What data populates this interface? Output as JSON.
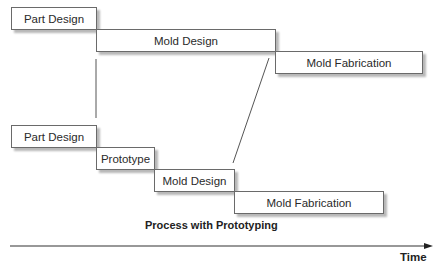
{
  "diagram": {
    "top_process": {
      "steps": [
        {
          "label": "Part Design"
        },
        {
          "label": "Mold Design"
        },
        {
          "label": "Mold Fabrication"
        }
      ]
    },
    "bottom_process": {
      "title": "Process with Prototyping",
      "steps": [
        {
          "label": "Part Design"
        },
        {
          "label": "Prototype"
        },
        {
          "label": "Mold Design"
        },
        {
          "label": "Mold Fabrication"
        }
      ]
    },
    "axis": {
      "label": "Time"
    }
  }
}
